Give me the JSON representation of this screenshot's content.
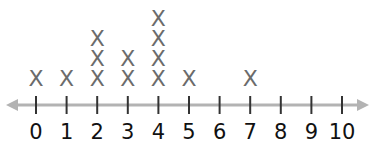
{
  "chart_data": {
    "type": "line-plot",
    "title": "",
    "xlabel": "",
    "ylabel": "",
    "categories": [
      "0",
      "1",
      "2",
      "3",
      "4",
      "5",
      "6",
      "7",
      "8",
      "9",
      "10"
    ],
    "x": [
      0,
      1,
      2,
      3,
      4,
      5,
      6,
      7,
      8,
      9,
      10
    ],
    "values": [
      1,
      1,
      3,
      2,
      4,
      1,
      0,
      1,
      0,
      0,
      0
    ],
    "marker": "X",
    "xlim": [
      0,
      10
    ],
    "grid": false,
    "axis_arrows": "both"
  },
  "colors": {
    "axis": "#b3b3b3",
    "tick": "#333333",
    "marker": "#6b6b6b",
    "label": "#111111"
  }
}
